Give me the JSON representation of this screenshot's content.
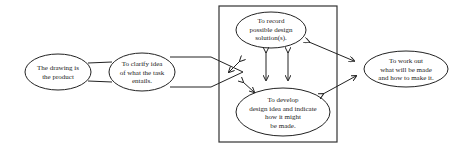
{
  "diagram": {
    "nodes": {
      "product": {
        "lines": [
          "The drawing is",
          "the product"
        ]
      },
      "clarify": {
        "lines": [
          "To clarify idea",
          "of what the task",
          "entails."
        ]
      },
      "record": {
        "lines": [
          "To record",
          "possible design",
          "solution(s)."
        ]
      },
      "develop": {
        "lines": [
          "To develop",
          "design idea and indicate",
          "how it might",
          "be made."
        ]
      },
      "workout": {
        "lines": [
          "To work out",
          "what will be made",
          "and how to make it."
        ]
      }
    },
    "colors": {
      "stroke": "#222222",
      "background": "#ffffff"
    }
  }
}
